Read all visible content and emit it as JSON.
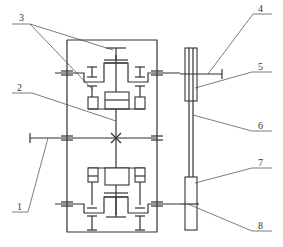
{
  "diagram": {
    "type": "mechanical-schematic",
    "stroke_color": "#333333",
    "background": "#ffffff",
    "labels": [
      {
        "id": "1",
        "text": "1"
      },
      {
        "id": "2",
        "text": "2"
      },
      {
        "id": "3",
        "text": "3"
      },
      {
        "id": "4",
        "text": "4"
      },
      {
        "id": "5",
        "text": "5"
      },
      {
        "id": "6",
        "text": "6"
      },
      {
        "id": "7",
        "text": "7"
      },
      {
        "id": "8",
        "text": "8"
      }
    ]
  }
}
